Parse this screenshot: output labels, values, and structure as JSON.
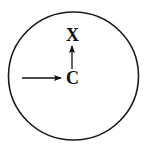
{
  "diagram": {
    "boundary": {
      "shape": "circle",
      "cx": 73.5,
      "cy": 76,
      "rx": 65,
      "ry": 64,
      "stroke": "#1a1a1a",
      "stroke_width": 1.6
    },
    "labels": {
      "top": "X",
      "center": "C"
    },
    "arrows": [
      {
        "id": "incoming",
        "from": [
          22,
          78
        ],
        "to": [
          60,
          78
        ],
        "description": "horizontal arrow pointing right toward C"
      },
      {
        "id": "up",
        "from": [
          72,
          69
        ],
        "to": [
          72,
          47
        ],
        "description": "vertical arrow from C pointing up toward X"
      }
    ],
    "colors": {
      "ink": "#111111",
      "background": "#ffffff"
    }
  }
}
